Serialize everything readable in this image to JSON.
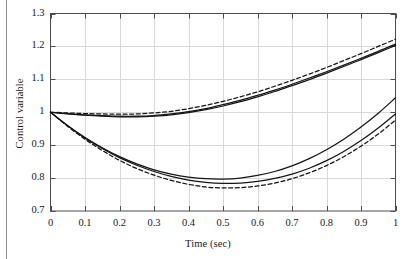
{
  "chart_data": {
    "type": "line",
    "title": "",
    "xlabel": "Time (sec)",
    "ylabel": "Control variable",
    "xlim": [
      0,
      1
    ],
    "ylim": [
      0.7,
      1.3
    ],
    "xticks": [
      "0",
      "0.1",
      "0.2",
      "0.3",
      "0.4",
      "0.5",
      "0.6",
      "0.7",
      "0.8",
      "0.9",
      "1"
    ],
    "xtick_values": [
      0,
      0.1,
      0.2,
      0.3,
      0.4,
      0.5,
      0.6,
      0.7,
      0.8,
      0.9,
      1
    ],
    "yticks": [
      "0.7",
      "0.8",
      "0.9",
      "1",
      "1.1",
      "1.2",
      "1.3"
    ],
    "ytick_values": [
      0.7,
      0.8,
      0.9,
      1.0,
      1.1,
      1.2,
      1.3
    ],
    "grid": true,
    "legend": "none",
    "x": [
      0,
      0.05,
      0.1,
      0.15,
      0.2,
      0.25,
      0.3,
      0.35,
      0.4,
      0.45,
      0.5,
      0.55,
      0.6,
      0.65,
      0.7,
      0.75,
      0.8,
      0.85,
      0.9,
      0.95,
      1.0
    ],
    "series": [
      {
        "name": "upper-dashed",
        "style": "dashed",
        "values": [
          1.0,
          0.998,
          0.996,
          0.995,
          0.994,
          0.995,
          0.998,
          1.003,
          1.011,
          1.021,
          1.033,
          1.047,
          1.062,
          1.079,
          1.097,
          1.116,
          1.136,
          1.157,
          1.178,
          1.2,
          1.222
        ]
      },
      {
        "name": "upper-solid-a",
        "style": "solid",
        "values": [
          1.0,
          0.996,
          0.992,
          0.99,
          0.988,
          0.988,
          0.99,
          0.995,
          1.002,
          1.011,
          1.023,
          1.036,
          1.051,
          1.067,
          1.085,
          1.104,
          1.123,
          1.143,
          1.164,
          1.185,
          1.207
        ]
      },
      {
        "name": "upper-solid-b",
        "style": "solid",
        "values": [
          1.0,
          0.995,
          0.991,
          0.988,
          0.986,
          0.986,
          0.988,
          0.992,
          0.999,
          1.008,
          1.019,
          1.032,
          1.047,
          1.063,
          1.081,
          1.099,
          1.119,
          1.139,
          1.16,
          1.181,
          1.203
        ]
      },
      {
        "name": "lower-solid-a",
        "style": "solid",
        "values": [
          1.0,
          0.959,
          0.922,
          0.89,
          0.862,
          0.839,
          0.82,
          0.805,
          0.794,
          0.787,
          0.784,
          0.785,
          0.79,
          0.799,
          0.812,
          0.83,
          0.853,
          0.881,
          0.914,
          0.952,
          0.995
        ]
      },
      {
        "name": "lower-solid-b",
        "style": "solid",
        "values": [
          1.0,
          0.959,
          0.923,
          0.892,
          0.865,
          0.843,
          0.825,
          0.812,
          0.803,
          0.798,
          0.797,
          0.8,
          0.808,
          0.82,
          0.837,
          0.859,
          0.886,
          0.918,
          0.955,
          0.997,
          1.044
        ]
      },
      {
        "name": "lower-dashed",
        "style": "dashed",
        "values": [
          1.0,
          0.957,
          0.918,
          0.884,
          0.854,
          0.829,
          0.809,
          0.793,
          0.781,
          0.773,
          0.77,
          0.771,
          0.776,
          0.785,
          0.798,
          0.816,
          0.838,
          0.865,
          0.897,
          0.934,
          0.976
        ]
      }
    ]
  },
  "figure": {
    "axis_color": "#4d4d4d",
    "grid_color": "#d9d9d9",
    "line_color": "#151515",
    "background": "#ffffff"
  }
}
